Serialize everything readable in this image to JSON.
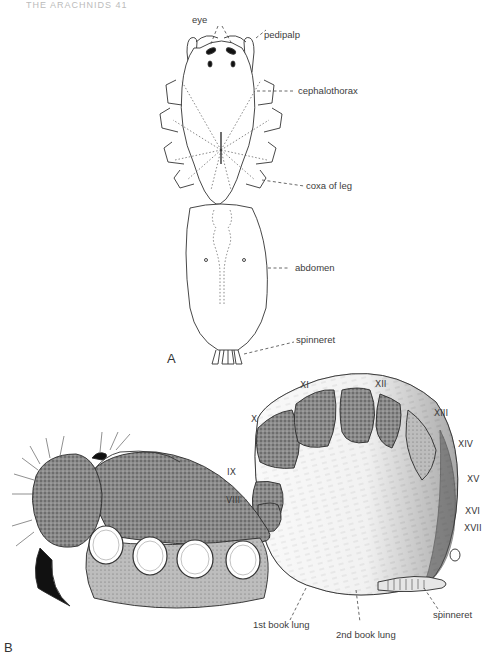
{
  "header": {
    "running_head": "THE ARACHNIDS    41"
  },
  "figure_a": {
    "panel_label": "A",
    "labels": {
      "eye": "eye",
      "pedipalp": "pedipalp",
      "cephalothorax": "cephalothorax",
      "coxa_of_leg": "coxa of leg",
      "abdomen": "abdomen",
      "spinneret": "spinneret"
    }
  },
  "figure_b": {
    "panel_label": "B",
    "segments": [
      "VIII",
      "IX",
      "X",
      "XI",
      "XII",
      "XIII",
      "XIV",
      "XV",
      "XVI",
      "XVII"
    ],
    "labels": {
      "book_lung_1": "1st book lung",
      "book_lung_2": "2nd book lung",
      "spinneret": "spinneret"
    }
  },
  "colors": {
    "ink": "#2a2a2a",
    "shade_dark": "#5a5a5a",
    "shade_mid": "#9a9a9a",
    "shade_light": "#d6d6d6",
    "paper": "#ffffff"
  }
}
